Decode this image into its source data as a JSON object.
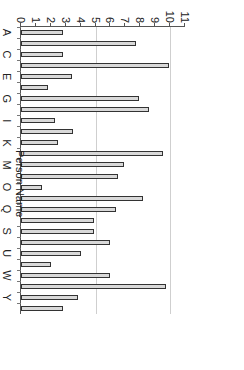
{
  "chart_data": {
    "type": "bar",
    "orientation": "rotated-90-clockwise",
    "title": "",
    "xlabel": "Person Name",
    "ylabel": "Pages / Hr",
    "ylim": [
      0,
      11
    ],
    "yticks": [
      0,
      1,
      2,
      3,
      4,
      5,
      6,
      7,
      8,
      9,
      10,
      11
    ],
    "gridlines": [
      5,
      10
    ],
    "xtick_labels_shown": [
      "A",
      "C",
      "E",
      "G",
      "I",
      "K",
      "M",
      "O",
      "Q",
      "S",
      "U",
      "W",
      "Y"
    ],
    "categories": [
      "A",
      "B",
      "C",
      "D",
      "E",
      "F",
      "G",
      "H",
      "I",
      "J",
      "K",
      "L",
      "M",
      "N",
      "O",
      "P",
      "Q",
      "R",
      "S",
      "T",
      "U",
      "V",
      "W",
      "X",
      "Y",
      "Z"
    ],
    "values": [
      2.8,
      7.7,
      2.8,
      9.9,
      3.4,
      1.8,
      7.9,
      8.6,
      2.3,
      3.5,
      2.5,
      9.5,
      6.9,
      6.5,
      1.4,
      8.2,
      6.4,
      4.9,
      4.9,
      6.0,
      4.0,
      2.0,
      6.0,
      9.7,
      3.8,
      2.8
    ],
    "bar_fill": "#d9d9d9",
    "bar_edge": "#333333",
    "grid_color": "#cfcfcf"
  },
  "axis": {
    "x_title": "Person Name",
    "y_title": "Pages / Hr"
  }
}
